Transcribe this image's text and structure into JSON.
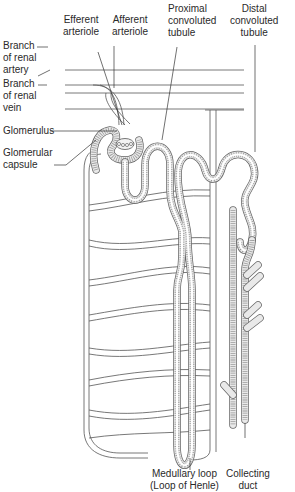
{
  "diagram": {
    "labels": {
      "efferent_arteriole": [
        "Efferent",
        "arteriole"
      ],
      "afferent_arteriole": [
        "Afferent",
        "arteriole"
      ],
      "proximal_tubule": [
        "Proximal",
        "convoluted",
        "tubule"
      ],
      "distal_tubule": [
        "Distal",
        "convoluted",
        "tubule"
      ],
      "renal_artery_branch": [
        "Branch",
        "of renal",
        "artery"
      ],
      "renal_vein_branch": [
        "Branch",
        "of renal",
        "vein"
      ],
      "glomerulus": [
        "Glomerulus"
      ],
      "glomerular_capsule": [
        "Glomerular",
        "capsule"
      ],
      "medullary_loop": [
        "Medullary loop",
        "(Loop of Henle)"
      ],
      "collecting_duct": [
        "Collecting",
        "duct"
      ]
    },
    "colors": {
      "line": "#555555",
      "tubule_wall": "#666666",
      "tubule_fill": "#e9e9e9",
      "background": "#ffffff"
    }
  }
}
